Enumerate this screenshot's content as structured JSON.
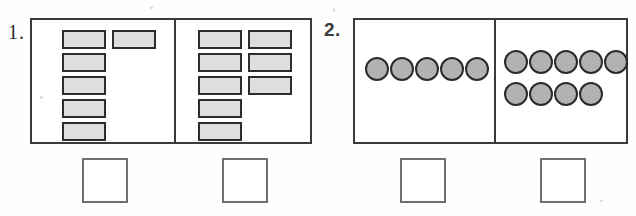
{
  "worksheet": {
    "background_color": "#ffffff",
    "counter_fill_rect": "#dedede",
    "counter_fill_circle": "#b2b2b2",
    "counter_border": "#2d2d2d",
    "frame_border": "#3a3a3a",
    "answer_box_border": "#6f6f6f"
  },
  "problems": [
    {
      "number_label": "1.",
      "counter_shape": "rectangle",
      "groups": [
        {
          "position": "left",
          "count": 6,
          "counters": [
            {
              "x": 30,
              "y": 10,
              "label": "rectangle-counter"
            },
            {
              "x": 30,
              "y": 33,
              "label": "rectangle-counter"
            },
            {
              "x": 30,
              "y": 56,
              "label": "rectangle-counter"
            },
            {
              "x": 30,
              "y": 79,
              "label": "rectangle-counter"
            },
            {
              "x": 30,
              "y": 102,
              "label": "rectangle-counter"
            },
            {
              "x": 80,
              "y": 10,
              "label": "rectangle-counter"
            }
          ],
          "answer_box": {
            "x": 82,
            "y": 158,
            "value": "",
            "placeholder": ""
          }
        },
        {
          "position": "right",
          "count": 8,
          "counters": [
            {
              "x": 22,
              "y": 10,
              "label": "rectangle-counter"
            },
            {
              "x": 22,
              "y": 33,
              "label": "rectangle-counter"
            },
            {
              "x": 22,
              "y": 56,
              "label": "rectangle-counter"
            },
            {
              "x": 22,
              "y": 79,
              "label": "rectangle-counter"
            },
            {
              "x": 22,
              "y": 102,
              "label": "rectangle-counter"
            },
            {
              "x": 72,
              "y": 10,
              "label": "rectangle-counter"
            },
            {
              "x": 72,
              "y": 33,
              "label": "rectangle-counter"
            },
            {
              "x": 72,
              "y": 56,
              "label": "rectangle-counter"
            }
          ],
          "answer_box": {
            "x": 222,
            "y": 158,
            "value": "",
            "placeholder": ""
          }
        }
      ]
    },
    {
      "number_label": "2.",
      "counter_shape": "circle",
      "groups": [
        {
          "position": "left",
          "count": 5,
          "counters": [
            {
              "x": 10,
              "y": 37,
              "label": "circle-counter"
            },
            {
              "x": 35,
              "y": 37,
              "label": "circle-counter"
            },
            {
              "x": 60,
              "y": 37,
              "label": "circle-counter"
            },
            {
              "x": 85,
              "y": 37,
              "label": "circle-counter"
            },
            {
              "x": 110,
              "y": 37,
              "label": "circle-counter"
            }
          ],
          "answer_box": {
            "x": 400,
            "y": 158,
            "value": "",
            "placeholder": ""
          }
        },
        {
          "position": "right",
          "count": 9,
          "counters": [
            {
              "x": 8,
              "y": 30,
              "label": "circle-counter"
            },
            {
              "x": 33,
              "y": 30,
              "label": "circle-counter"
            },
            {
              "x": 58,
              "y": 30,
              "label": "circle-counter"
            },
            {
              "x": 83,
              "y": 30,
              "label": "circle-counter"
            },
            {
              "x": 108,
              "y": 30,
              "label": "circle-counter"
            },
            {
              "x": 8,
              "y": 62,
              "label": "circle-counter"
            },
            {
              "x": 33,
              "y": 62,
              "label": "circle-counter"
            },
            {
              "x": 58,
              "y": 62,
              "label": "circle-counter"
            },
            {
              "x": 83,
              "y": 62,
              "label": "circle-counter"
            }
          ],
          "answer_box": {
            "x": 540,
            "y": 158,
            "value": "",
            "placeholder": ""
          }
        }
      ]
    }
  ]
}
